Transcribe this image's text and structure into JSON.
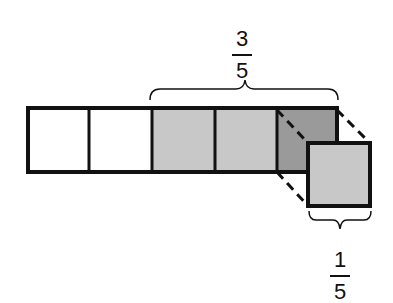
{
  "diagram": {
    "type": "fraction-bar",
    "total_parts": 5,
    "shaded_parts": 3,
    "removed_parts": 1,
    "colors": {
      "unshaded": "#ffffff",
      "shaded": "#c8c8c8",
      "shadow": "#9a9a9a",
      "outline": "#111111"
    },
    "labels": {
      "top_fraction": {
        "numerator": "3",
        "denominator": "5"
      },
      "bottom_fraction": {
        "numerator": "1",
        "denominator": "5"
      }
    }
  }
}
